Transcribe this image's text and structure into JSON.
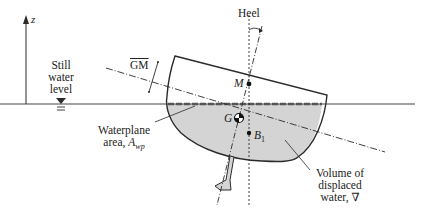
{
  "figure": {
    "type": "ship-stability-diagram",
    "colors": {
      "line": "#2a2a2a",
      "water_fill": "#d4d4d4",
      "waterline_dashes": "#555555",
      "background": "#ffffff"
    },
    "axis": {
      "label": "z"
    },
    "labels": {
      "heel": "Heel",
      "gm": "GM",
      "still_water_line1": "Still",
      "still_water_line2": "water",
      "still_water_line3": "level",
      "metacenter": "M",
      "center_of_gravity": "G",
      "center_of_buoyancy": "B",
      "center_of_buoyancy_sub": "1",
      "waterplane_line1": "Waterplane",
      "waterplane_line2_prefix": "area, ",
      "waterplane_symbol": "A",
      "waterplane_sub": "wp",
      "volume_line1": "Volume of",
      "volume_line2": "displaced",
      "volume_line3": "water, ∇"
    }
  }
}
